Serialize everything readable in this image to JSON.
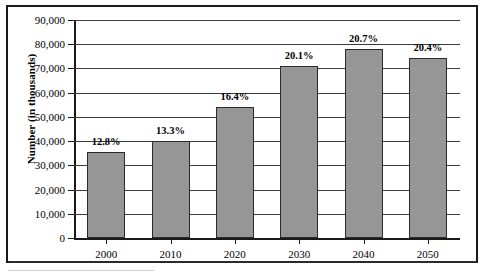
{
  "chart_data": {
    "type": "bar",
    "title": "",
    "xlabel": "",
    "ylabel": "Number (in thousands)",
    "categories": [
      "2000",
      "2010",
      "2020",
      "2030",
      "2040",
      "2050"
    ],
    "values": [
      35500,
      40200,
      54000,
      71000,
      78000,
      74500
    ],
    "data_labels": [
      "12.8%",
      "13.3%",
      "16.4%",
      "20.1%",
      "20.7%",
      "20.4%"
    ],
    "ylim": [
      0,
      90000
    ],
    "ytick_values": [
      0,
      10000,
      20000,
      30000,
      40000,
      50000,
      60000,
      70000,
      80000,
      90000
    ],
    "ytick_labels": [
      "0",
      "10,000",
      "20,000",
      "30,000",
      "40,000",
      "50,000",
      "60,000",
      "70,000",
      "80,000",
      "90,000"
    ],
    "grid": true,
    "grid_axis": "y",
    "legend": false,
    "legend_position": "none",
    "series": [
      {
        "name": "Number (in thousands)",
        "values": [
          35500,
          40200,
          54000,
          71000,
          78000,
          74500
        ]
      }
    ],
    "colors": {
      "bar_fill": "#969696",
      "bar_stroke": "#2b2b2b",
      "gridline": "#3c3c3c",
      "axis": "#1a1a1a",
      "frame": "#1a1a1a",
      "background": "#ffffff",
      "text": "#000000"
    }
  }
}
